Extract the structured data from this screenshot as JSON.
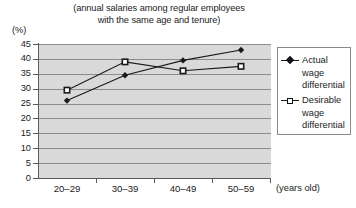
{
  "chart_data": {
    "type": "line",
    "title": "(annual salaries among regular employees with the same age and tenure)",
    "title_lines": [
      "(annual salaries among regular employees",
      "with the same age and tenure)"
    ],
    "categories": [
      "20–29",
      "30–39",
      "40–49",
      "50–59"
    ],
    "series": [
      {
        "name": "Actual wage differential",
        "name_lines": [
          "Actual",
          "wage",
          "differential"
        ],
        "marker": "diamond",
        "values": [
          26,
          34.5,
          39.5,
          43
        ]
      },
      {
        "name": "Desirable wage differential",
        "name_lines": [
          "Desirable",
          "wage",
          "differential"
        ],
        "marker": "square",
        "values": [
          29.5,
          39,
          36,
          37.5
        ]
      }
    ],
    "xlabel": "(years old)",
    "ylabel": "(%)",
    "ylim": [
      0,
      45
    ],
    "yticks": [
      45,
      40,
      35,
      30,
      25,
      20,
      15,
      10,
      5,
      0
    ],
    "ytick_labels": [
      "45",
      "40",
      "35",
      "30",
      "25",
      "20",
      "15",
      "10",
      "5",
      "0"
    ],
    "grid": true,
    "legend_position": "right",
    "colors": {
      "plot_background": "#d9d9d9",
      "gridline": "#8c8c8c",
      "axis": "#5a5a5a",
      "series_line": "#1a1a1a",
      "text": "#1c1c1c",
      "page_background": "#ffffff"
    }
  }
}
